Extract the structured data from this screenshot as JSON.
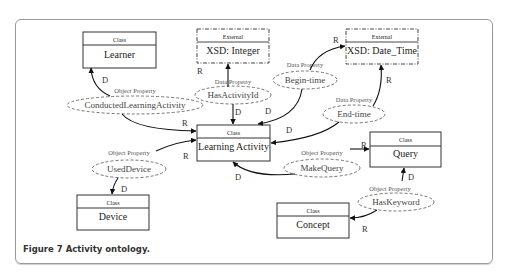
{
  "figure": {
    "caption": "Figure 7 Activity ontology."
  },
  "classes": {
    "learner": {
      "stereotype": "Class",
      "name": "Learner"
    },
    "learning_activity": {
      "stereotype": "Class",
      "name": "Learning Activity"
    },
    "query": {
      "stereotype": "Class",
      "name": "Query"
    },
    "device": {
      "stereotype": "Class",
      "name": "Device"
    },
    "concept": {
      "stereotype": "Class",
      "name": "Concept"
    }
  },
  "externals": {
    "integer": {
      "stereotype": "External",
      "name": "XSD: Integer"
    },
    "datetime": {
      "stereotype": "External",
      "name": "XSD: Date_Time"
    }
  },
  "properties": {
    "conducted": {
      "type": "Object Property",
      "name": "ConductedLearningActivity"
    },
    "has_activity_id": {
      "type": "Data Property",
      "name": "HasActivityId"
    },
    "begin_time": {
      "type": "Data Property",
      "name": "Begin-time"
    },
    "end_time": {
      "type": "Data Property",
      "name": "End-time"
    },
    "used_device": {
      "type": "Object Property",
      "name": "UsedDevice"
    },
    "make_query": {
      "type": "Object Property",
      "name": "MakeQuery"
    },
    "has_keyword": {
      "type": "Object Property",
      "name": "HasKeyword"
    }
  },
  "edge_labels": {
    "domain": "D",
    "range": "R"
  }
}
